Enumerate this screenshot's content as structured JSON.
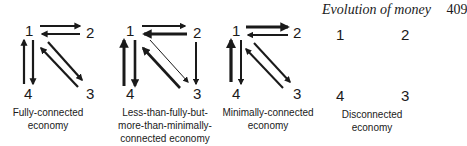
{
  "header": {
    "title": "Evolution of money",
    "page_number": "409"
  },
  "panels": [
    {
      "caption_lines": [
        "Fully-connected",
        "economy"
      ],
      "nodes": {
        "n1": "1",
        "n2": "2",
        "n3": "3",
        "n4": "4"
      },
      "edges": [
        "1→2",
        "2→1",
        "1→3",
        "3→1",
        "1→4",
        "4→1"
      ]
    },
    {
      "caption_lines": [
        "Less-than-fully-but-",
        "more-than-minimally-",
        "connected economy"
      ],
      "nodes": {
        "n1": "1",
        "n2": "2",
        "n3": "3",
        "n4": "4"
      },
      "edges": [
        "1→2",
        "2→1",
        "2→3",
        "1→3 (thin)",
        "3→1",
        "1→4",
        "4→1"
      ]
    },
    {
      "caption_lines": [
        "Minimally-connected",
        "economy"
      ],
      "nodes": {
        "n1": "1",
        "n2": "2",
        "n3": "3",
        "n4": "4"
      },
      "edges": [
        "1→2",
        "2→1",
        "1→3",
        "3→1",
        "1→4",
        "4→1"
      ]
    },
    {
      "caption_lines": [
        "Disconnected",
        "economy"
      ],
      "nodes": {
        "n1": "1",
        "n2": "2",
        "n3": "3",
        "n4": "4"
      },
      "edges": []
    }
  ]
}
